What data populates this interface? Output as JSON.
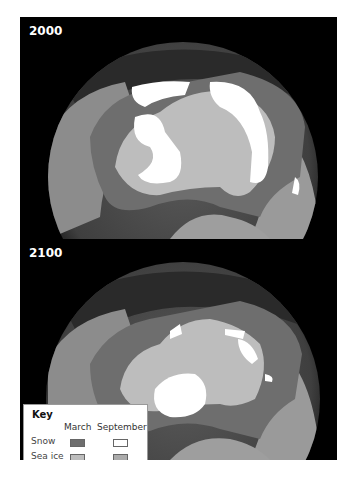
{
  "panels": [
    {
      "year": "2000"
    },
    {
      "year": "2100"
    }
  ],
  "key": {
    "title": "Key",
    "columns": [
      "March",
      "September"
    ],
    "rows": [
      {
        "label": "Snow",
        "march_color": "#6e6e6e",
        "september_color": "#ffffff"
      },
      {
        "label": "Sea ice",
        "march_color": "#bdbdbd",
        "september_color": "#ababab"
      }
    ]
  },
  "colors": {
    "background": "#000000",
    "ocean": "#4a4a4a",
    "land": "#8a8a8a",
    "snow_march": "#6e6e6e",
    "snow_september": "#ffffff",
    "sea_ice_march": "#bdbdbd",
    "sea_ice_september": "#ababab"
  }
}
